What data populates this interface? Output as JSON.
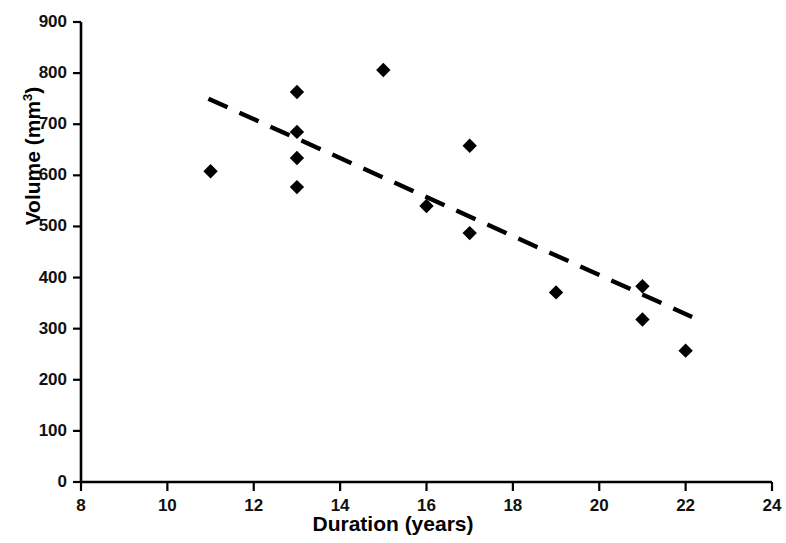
{
  "chart_data": {
    "type": "scatter",
    "title": "",
    "xlabel": "Duration (years)",
    "ylabel_text": "Volume (mm",
    "ylabel_sup": "3",
    "ylabel_tail": ")",
    "ylabel": "Volume (mm3)",
    "xlim": [
      8,
      24
    ],
    "ylim": [
      0,
      900
    ],
    "grid": false,
    "legend": null,
    "xticks": [
      8,
      10,
      12,
      14,
      16,
      18,
      20,
      22,
      24
    ],
    "xtick_labels": [
      "8",
      "10",
      "12",
      "14",
      "16",
      "18",
      "20",
      "22",
      "24"
    ],
    "yticks": [
      0,
      100,
      200,
      300,
      400,
      500,
      600,
      700,
      800,
      900
    ],
    "ytick_labels": [
      "0",
      "100",
      "200",
      "300",
      "400",
      "500",
      "600",
      "700",
      "800",
      "900"
    ],
    "marker": "diamond",
    "marker_color": "#000000",
    "points": [
      {
        "x": 11,
        "y": 608
      },
      {
        "x": 13,
        "y": 763
      },
      {
        "x": 13,
        "y": 685
      },
      {
        "x": 13,
        "y": 634
      },
      {
        "x": 13,
        "y": 577
      },
      {
        "x": 15,
        "y": 806
      },
      {
        "x": 16,
        "y": 540
      },
      {
        "x": 17,
        "y": 658
      },
      {
        "x": 17,
        "y": 487
      },
      {
        "x": 19,
        "y": 371
      },
      {
        "x": 21,
        "y": 383
      },
      {
        "x": 21,
        "y": 318
      },
      {
        "x": 22,
        "y": 257
      }
    ],
    "trendline": {
      "style": "dashed",
      "color": "#000000",
      "x_start": 10.95,
      "y_start": 750,
      "x_end": 22.15,
      "y_end": 323
    },
    "axis_color": "#000000"
  }
}
